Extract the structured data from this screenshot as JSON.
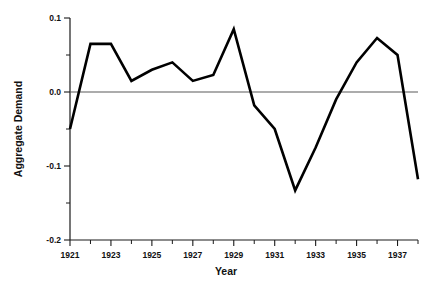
{
  "chart_data": {
    "type": "line",
    "title": "",
    "subtitle": "",
    "xlabel": "Year",
    "ylabel": "Aggregate Demand",
    "x": [
      1921,
      1922,
      1923,
      1924,
      1925,
      1926,
      1927,
      1928,
      1929,
      1930,
      1931,
      1932,
      1933,
      1934,
      1935,
      1936,
      1937,
      1938
    ],
    "values": [
      -0.05,
      0.065,
      0.065,
      0.015,
      0.03,
      0.04,
      0.015,
      0.023,
      0.085,
      -0.018,
      -0.05,
      -0.133,
      -0.075,
      -0.01,
      0.04,
      0.073,
      0.05,
      -0.118
    ],
    "series": [
      {
        "name": "Aggregate Demand",
        "values": [
          -0.05,
          0.065,
          0.065,
          0.015,
          0.03,
          0.04,
          0.015,
          0.023,
          0.085,
          -0.018,
          -0.05,
          -0.133,
          -0.075,
          -0.01,
          0.04,
          0.073,
          0.05,
          -0.118
        ]
      }
    ],
    "xlim": [
      1921,
      1938
    ],
    "ylim": [
      -0.2,
      0.1
    ],
    "grid": false,
    "legend": "none",
    "zero_reference_line": 0.0,
    "y_ticks_major": [
      "0.1",
      "0.0",
      "-0.1",
      "-0.2"
    ],
    "y_tick_values_major": [
      0.1,
      0.0,
      -0.1,
      -0.2
    ],
    "y_tick_values_minor": [
      0.05,
      -0.05,
      -0.15
    ],
    "x_ticks_major": [
      "1921",
      "1923",
      "1925",
      "1927",
      "1929",
      "1931",
      "1933",
      "1935",
      "1937"
    ],
    "x_tick_values_major": [
      1921,
      1923,
      1925,
      1927,
      1929,
      1931,
      1933,
      1935,
      1937
    ],
    "x_tick_values_minor": [
      1922,
      1924,
      1926,
      1928,
      1930,
      1932,
      1934,
      1936,
      1938
    ],
    "colors": {
      "line": "#000000",
      "axis": "#1a1a1a",
      "zero_line": "#5a5a5a",
      "background": "#ffffff",
      "text": "#111111"
    }
  }
}
